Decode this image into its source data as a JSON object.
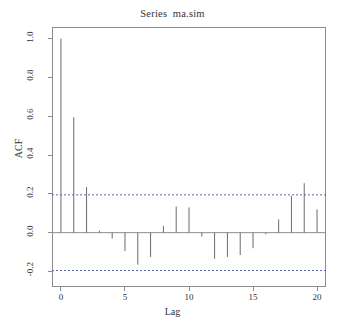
{
  "chart_data": {
    "type": "bar",
    "title": "Series  ma.sim",
    "xlabel": "Lag",
    "ylabel": "ACF",
    "grid": false,
    "legend": "none",
    "xlim": [
      -0.7,
      20.7
    ],
    "ylim": [
      -0.28,
      1.06
    ],
    "xticks": [
      0,
      5,
      10,
      15,
      20
    ],
    "xtick_labels": [
      "0",
      "5",
      "10",
      "15",
      "20"
    ],
    "yticks": [
      -0.2,
      0.0,
      0.2,
      0.4,
      0.6,
      0.8,
      1.0
    ],
    "ytick_labels": [
      "-0.2",
      "0.0",
      "0.2",
      "0.4",
      "0.6",
      "0.8",
      "1.0"
    ],
    "categories": [
      0,
      1,
      2,
      3,
      4,
      5,
      6,
      7,
      8,
      9,
      10,
      11,
      12,
      13,
      14,
      15,
      16,
      17,
      18,
      19,
      20
    ],
    "values": [
      1.0,
      0.595,
      0.235,
      0.01,
      -0.03,
      -0.095,
      -0.165,
      -0.125,
      0.035,
      0.135,
      0.13,
      -0.02,
      -0.135,
      -0.125,
      -0.115,
      -0.08,
      -0.008,
      0.068,
      0.19,
      0.255,
      0.12
    ],
    "zero_line": 0.0,
    "confidence_bands": {
      "upper": 0.195,
      "lower": -0.195,
      "style": "dashed",
      "color": "#5a6aa8"
    },
    "series_color": "#6b6b6b"
  },
  "figure": {
    "title": "Series  ma.sim",
    "xlabel": "Lag",
    "ylabel": "ACF"
  }
}
